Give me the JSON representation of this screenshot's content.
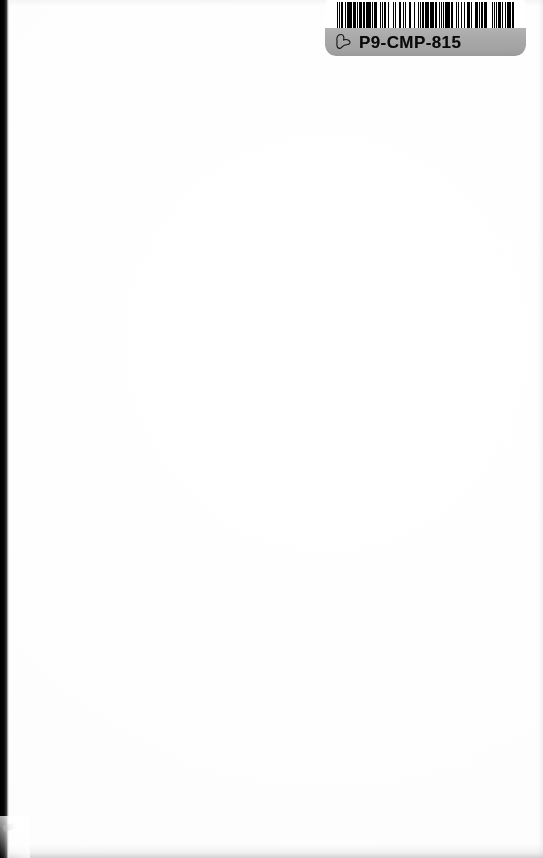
{
  "page": {
    "kind": "scanned-blank-page",
    "background_color": "#ffffff",
    "gutter_color": "#000000"
  },
  "label": {
    "name": "library-barcode-label",
    "call_number": "P9-CMP-815",
    "band_color": "#a8a8a8",
    "background_color": "#ffffff",
    "icon": "hand-pointer-icon",
    "barcode": {
      "symbology": "code-39",
      "bar_color": "#000000",
      "space_color": "#ffffff",
      "modules": [
        2,
        1,
        1,
        2,
        3,
        1,
        1,
        1,
        2,
        1,
        4,
        1,
        2,
        2,
        1,
        1,
        3,
        1,
        1,
        2,
        2,
        1,
        1,
        1,
        3,
        2,
        1,
        1,
        2,
        1,
        3,
        1,
        1,
        2,
        1,
        1,
        2,
        3,
        1,
        1,
        1,
        2,
        2,
        1,
        3,
        1,
        1,
        1,
        2,
        2,
        1,
        3,
        1,
        1,
        2,
        1,
        1,
        2,
        3,
        1,
        1,
        1,
        2,
        1,
        2,
        2,
        1,
        1,
        3,
        1,
        1,
        2,
        2,
        1,
        1,
        3,
        1,
        1,
        2,
        1,
        3,
        2,
        1,
        1,
        2,
        1,
        1,
        1,
        3,
        1,
        2,
        2,
        1,
        1,
        1,
        3,
        2,
        1,
        1,
        2,
        1,
        1,
        3,
        1,
        2,
        1,
        1,
        2,
        2,
        3,
        1,
        1,
        1,
        2,
        1,
        3,
        2,
        1,
        1,
        1,
        2,
        2,
        3,
        1,
        1,
        1,
        2,
        1,
        1,
        3,
        2,
        1,
        1,
        2,
        1,
        1,
        3,
        2,
        1,
        1,
        2,
        1,
        1,
        2,
        1,
        3,
        1,
        1,
        2,
        2,
        1,
        1,
        3,
        1,
        1,
        1,
        2,
        3,
        1,
        2,
        1,
        1,
        2,
        1,
        1,
        1,
        3,
        2
      ]
    }
  }
}
